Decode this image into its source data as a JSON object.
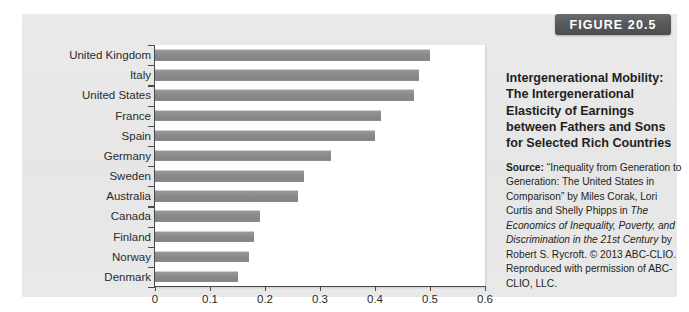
{
  "figure": {
    "badge_label": "FIGURE 20.5"
  },
  "caption": {
    "title": "Intergenerational Mobility: The Intergenerational Elasticity of Earnings between Fathers and Sons for Selected Rich Countries",
    "source_word": "Source:",
    "source_part1": " “Inequality from Generation to Generation: The United States in Comparison” by Miles Corak, Lori Curtis and Shelly Phipps in ",
    "source_italic1": "The Economics of Inequality, Poverty, and Discrimination in the 21st Century",
    "source_part2": " by Robert S. Rycroft. © 2013 ABC-CLIO. Reproduced with permission of ABC-CLIO, LLC."
  },
  "chart_data": {
    "type": "bar",
    "orientation": "horizontal",
    "title": "Intergenerational Mobility: The Intergenerational Elasticity of Earnings between Fathers and Sons for Selected Rich Countries",
    "xlabel": "",
    "ylabel": "",
    "xlim": [
      0,
      0.6
    ],
    "xticks": [
      0,
      0.1,
      0.2,
      0.3,
      0.4,
      0.5,
      0.6
    ],
    "xtick_labels": [
      "0",
      "0.1",
      "0.2",
      "0.3",
      "0.4",
      "0.5",
      "0.6"
    ],
    "grid": false,
    "legend": null,
    "bar_color": "#8d8d8d",
    "categories": [
      "United Kingdom",
      "Italy",
      "United States",
      "France",
      "Spain",
      "Germany",
      "Sweden",
      "Australia",
      "Canada",
      "Finland",
      "Norway",
      "Denmark"
    ],
    "values": [
      0.5,
      0.48,
      0.47,
      0.41,
      0.4,
      0.32,
      0.27,
      0.26,
      0.19,
      0.18,
      0.17,
      0.15
    ]
  }
}
